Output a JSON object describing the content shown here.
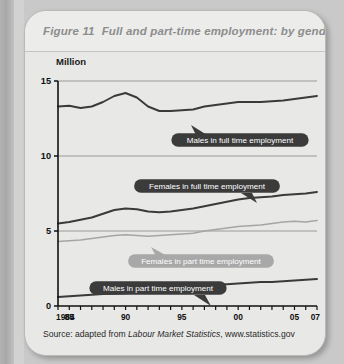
{
  "figure": {
    "number_label": "Figure 11",
    "title": "Full and part-time employment: by gender",
    "unit_label": "Million",
    "source_prefix": "Source: adapted from",
    "source_italic": "Labour Market Statistics",
    "source_suffix": ", www.statistics.gov"
  },
  "colors": {
    "page_background": "#c9c9c9",
    "card_background": "#e8e8e6",
    "title_text": "#8d8d8d",
    "axis": "#111111",
    "gridline": "#9a9a9a",
    "series_dark": "#3a3a3a",
    "series_light": "#a5a5a5",
    "callout_dark": "#3b3b3b",
    "callout_light": "#a8a8a8"
  },
  "chart_data": {
    "type": "line",
    "title": "Full and part-time employment: by gender",
    "xlabel": "",
    "ylabel": "Million",
    "ylim": [
      0,
      15
    ],
    "yticks": [
      0,
      5,
      10,
      15
    ],
    "ytick_labels": [
      "0",
      "5",
      "10",
      "15"
    ],
    "xlim": [
      1984,
      2007
    ],
    "xtick_labels": [
      "1984",
      "85",
      "90",
      "95",
      "00",
      "05",
      "07"
    ],
    "xtick_values": [
      1984,
      1985,
      1990,
      1995,
      2000,
      2005,
      2007
    ],
    "minor_ticks_every_year": true,
    "grid": true,
    "legend": "callouts",
    "x": [
      1984,
      1985,
      1986,
      1987,
      1988,
      1989,
      1990,
      1991,
      1992,
      1993,
      1994,
      1995,
      1996,
      1997,
      1998,
      1999,
      2000,
      2001,
      2002,
      2003,
      2004,
      2005,
      2006,
      2007
    ],
    "series": [
      {
        "name": "Males in full time employment",
        "style": "dark",
        "values": [
          13.3,
          13.35,
          13.2,
          13.3,
          13.6,
          14.0,
          14.2,
          13.9,
          13.3,
          13.0,
          13.0,
          13.05,
          13.1,
          13.3,
          13.4,
          13.5,
          13.6,
          13.6,
          13.6,
          13.65,
          13.7,
          13.8,
          13.9,
          14.0
        ]
      },
      {
        "name": "Females in full time employment",
        "style": "dark",
        "values": [
          5.5,
          5.6,
          5.75,
          5.9,
          6.15,
          6.4,
          6.5,
          6.45,
          6.3,
          6.25,
          6.3,
          6.4,
          6.5,
          6.65,
          6.8,
          6.95,
          7.1,
          7.2,
          7.25,
          7.3,
          7.4,
          7.45,
          7.5,
          7.6
        ]
      },
      {
        "name": "Females in part time employment",
        "style": "light",
        "values": [
          4.3,
          4.35,
          4.4,
          4.5,
          4.6,
          4.7,
          4.75,
          4.7,
          4.65,
          4.7,
          4.75,
          4.8,
          4.85,
          5.0,
          5.1,
          5.2,
          5.3,
          5.35,
          5.4,
          5.5,
          5.6,
          5.65,
          5.6,
          5.7
        ]
      },
      {
        "name": "Males in part time employment",
        "style": "dark",
        "values": [
          0.6,
          0.65,
          0.7,
          0.75,
          0.8,
          0.82,
          0.85,
          0.95,
          1.05,
          1.15,
          1.2,
          1.25,
          1.3,
          1.35,
          1.4,
          1.45,
          1.5,
          1.55,
          1.6,
          1.6,
          1.65,
          1.7,
          1.75,
          1.8
        ]
      }
    ],
    "callouts": [
      {
        "label": "Males in full time employment",
        "style": "dark",
        "tail": "top-left"
      },
      {
        "label": "Females in full time employment",
        "style": "dark",
        "tail": "bottom-right"
      },
      {
        "label": "Females in part time employment",
        "style": "light",
        "tail": "top-left"
      },
      {
        "label": "Males in part time employment",
        "style": "dark",
        "tail": "bottom-right"
      }
    ]
  }
}
